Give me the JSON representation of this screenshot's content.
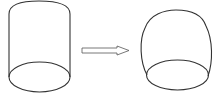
{
  "diagram": {
    "shapes": [
      {
        "id": "original-cylinder",
        "type": "cylinder",
        "label": ""
      },
      {
        "id": "transform-arrow",
        "type": "arrow",
        "direction": "right",
        "label": ""
      },
      {
        "id": "deformed-barrel",
        "type": "barrel",
        "label": ""
      }
    ],
    "colors": {
      "stroke": "#333333",
      "arrow_stroke": "#555555",
      "background": "#ffffff"
    }
  }
}
